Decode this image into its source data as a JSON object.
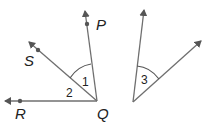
{
  "diagram": {
    "colors": {
      "line": "#6f6f6f",
      "text": "#222222",
      "point": "#555555"
    },
    "points": {
      "P": {
        "label": "P"
      },
      "S": {
        "label": "S"
      },
      "R": {
        "label": "R"
      },
      "Q": {
        "label": "Q"
      }
    },
    "angles": [
      {
        "id": "1",
        "label": "1",
        "between": [
          "QS",
          "QP"
        ]
      },
      {
        "id": "2",
        "label": "2",
        "between": [
          "QR",
          "QS"
        ]
      },
      {
        "id": "3",
        "label": "3",
        "between": [
          "left ray",
          "right ray"
        ]
      }
    ]
  }
}
